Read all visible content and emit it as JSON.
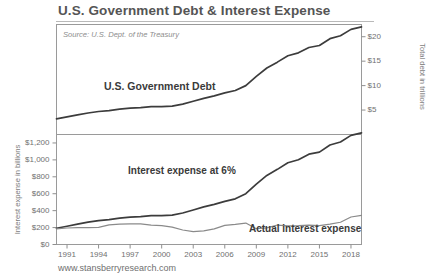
{
  "chart_data": {
    "type": "line",
    "title": "U.S. Government Debt & Interest Expense",
    "source_note": "Source: U.S. Dept. of the Treasury",
    "footer": "www.stansberryresearch.com",
    "xlabel": "",
    "x_ticks": [
      "1991",
      "1994",
      "1997",
      "2000",
      "2003",
      "2006",
      "2009",
      "2012",
      "2015",
      "2018"
    ],
    "xlim": [
      1990,
      2019
    ],
    "grid": false,
    "legend": "inline-annotations",
    "panels": [
      {
        "name": "debt-panel",
        "ylabel": "Total debt in trillions",
        "y_axis_side": "right",
        "y_ticks": [
          "$20",
          "$15",
          "$10",
          "$5"
        ],
        "y_tick_values": [
          20,
          15,
          10,
          5
        ],
        "ylim": [
          0,
          22.5
        ],
        "series": [
          {
            "name": "U.S. Government Debt",
            "label": "U.S. Government Debt",
            "color": "#3c3c3c",
            "x": [
              1990,
              1991,
              1992,
              1993,
              1994,
              1995,
              1996,
              1997,
              1998,
              1999,
              2000,
              2001,
              2002,
              2003,
              2004,
              2005,
              2006,
              2007,
              2008,
              2009,
              2010,
              2011,
              2012,
              2013,
              2014,
              2015,
              2016,
              2017,
              2018,
              2019
            ],
            "values": [
              3.2,
              3.6,
              4.0,
              4.4,
              4.7,
              4.9,
              5.2,
              5.4,
              5.5,
              5.7,
              5.7,
              5.8,
              6.2,
              6.8,
              7.4,
              7.9,
              8.5,
              9.0,
              10.0,
              11.9,
              13.6,
              14.8,
              16.1,
              16.7,
              17.8,
              18.2,
              19.6,
              20.2,
              21.5,
              22.0
            ]
          }
        ]
      },
      {
        "name": "interest-panel",
        "ylabel": "Interest expense in billions",
        "y_axis_side": "left",
        "y_ticks": [
          "$1,200",
          "$1,000",
          "$800",
          "$600",
          "$400",
          "$200",
          "$0"
        ],
        "y_tick_values": [
          1200,
          1000,
          800,
          600,
          400,
          200,
          0
        ],
        "ylim": [
          0,
          1300
        ],
        "series": [
          {
            "name": "Interest expense at 6%",
            "label": "Interest expense at 6%",
            "color": "#3c3c3c",
            "x": [
              1990,
              1991,
              1992,
              1993,
              1994,
              1995,
              1996,
              1997,
              1998,
              1999,
              2000,
              2001,
              2002,
              2003,
              2004,
              2005,
              2006,
              2007,
              2008,
              2009,
              2010,
              2011,
              2012,
              2013,
              2014,
              2015,
              2016,
              2017,
              2018,
              2019
            ],
            "values": [
              192,
              216,
              240,
              264,
              282,
              294,
              312,
              324,
              330,
              342,
              342,
              348,
              372,
              408,
              444,
              474,
              510,
              540,
              600,
              714,
              816,
              888,
              966,
              1002,
              1068,
              1092,
              1176,
              1212,
              1290,
              1320
            ]
          },
          {
            "name": "Actual interest expense",
            "label": "Actual interest expense",
            "color": "#8a8a8a",
            "x": [
              1990,
              1991,
              1992,
              1993,
              1994,
              1995,
              1996,
              1997,
              1998,
              1999,
              2000,
              2001,
              2002,
              2003,
              2004,
              2005,
              2006,
              2007,
              2008,
              2009,
              2010,
              2011,
              2012,
              2013,
              2014,
              2015,
              2016,
              2017,
              2018,
              2019
            ],
            "values": [
              184,
              195,
              199,
              199,
              203,
              232,
              241,
              244,
              243,
              230,
              223,
              206,
              171,
              153,
              160,
              184,
              226,
              237,
              253,
              187,
              196,
              230,
              220,
              223,
              229,
              223,
              241,
              263,
              325,
              345
            ]
          }
        ]
      }
    ]
  }
}
